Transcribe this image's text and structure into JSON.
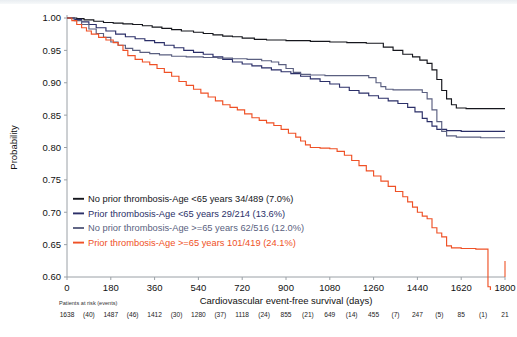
{
  "chart_data": {
    "type": "line",
    "title": "",
    "xlabel": "Cardiovascular event-free survival (days)",
    "ylabel": "Probability",
    "xlim": [
      0,
      1800
    ],
    "ylim": [
      0.6,
      1.0
    ],
    "xticks": [
      0,
      180,
      360,
      540,
      720,
      900,
      1080,
      1260,
      1440,
      1620,
      1800
    ],
    "yticks": [
      "1.00",
      "0.95",
      "0.90",
      "0.85",
      "0.80",
      "0.75",
      "0.70",
      "0.65",
      "0.60"
    ],
    "grid": false,
    "legend_position": "lower-left-inside",
    "series": [
      {
        "name": "No prior thrombosis-Age <65 years 34/489 (7.0%)",
        "color": "#15161c",
        "group": "No prior thrombosis",
        "age": "<65 years",
        "events": 34,
        "n": 489,
        "percent": "7.0%",
        "points": [
          [
            0,
            1.0
          ],
          [
            40,
            0.999
          ],
          [
            70,
            0.997
          ],
          [
            110,
            0.995
          ],
          [
            150,
            0.993
          ],
          [
            190,
            0.992
          ],
          [
            230,
            0.991
          ],
          [
            270,
            0.99
          ],
          [
            310,
            0.988
          ],
          [
            350,
            0.986
          ],
          [
            390,
            0.984
          ],
          [
            430,
            0.982
          ],
          [
            470,
            0.98
          ],
          [
            520,
            0.978
          ],
          [
            560,
            0.976
          ],
          [
            600,
            0.974
          ],
          [
            640,
            0.972
          ],
          [
            680,
            0.971
          ],
          [
            720,
            0.969
          ],
          [
            770,
            0.967
          ],
          [
            820,
            0.966
          ],
          [
            900,
            0.965
          ],
          [
            1000,
            0.964
          ],
          [
            1080,
            0.963
          ],
          [
            1150,
            0.962
          ],
          [
            1230,
            0.961
          ],
          [
            1300,
            0.955
          ],
          [
            1340,
            0.95
          ],
          [
            1380,
            0.944
          ],
          [
            1420,
            0.94
          ],
          [
            1450,
            0.935
          ],
          [
            1480,
            0.93
          ],
          [
            1500,
            0.92
          ],
          [
            1520,
            0.905
          ],
          [
            1540,
            0.888
          ],
          [
            1560,
            0.875
          ],
          [
            1580,
            0.866
          ],
          [
            1600,
            0.861
          ],
          [
            1640,
            0.86
          ],
          [
            1700,
            0.86
          ],
          [
            1800,
            0.86
          ]
        ]
      },
      {
        "name": "Prior thrombosis-Age <65 years 29/214 (13.6%)",
        "color": "#2b2f68",
        "group": "Prior thrombosis",
        "age": "<65 years",
        "events": 29,
        "n": 214,
        "percent": "13.6%",
        "points": [
          [
            0,
            1.0
          ],
          [
            30,
            0.998
          ],
          [
            60,
            0.994
          ],
          [
            90,
            0.99
          ],
          [
            120,
            0.985
          ],
          [
            160,
            0.98
          ],
          [
            200,
            0.975
          ],
          [
            240,
            0.971
          ],
          [
            280,
            0.968
          ],
          [
            320,
            0.965
          ],
          [
            360,
            0.962
          ],
          [
            400,
            0.958
          ],
          [
            440,
            0.954
          ],
          [
            480,
            0.95
          ],
          [
            520,
            0.947
          ],
          [
            560,
            0.944
          ],
          [
            600,
            0.94
          ],
          [
            640,
            0.936
          ],
          [
            680,
            0.932
          ],
          [
            720,
            0.929
          ],
          [
            760,
            0.926
          ],
          [
            800,
            0.923
          ],
          [
            840,
            0.92
          ],
          [
            880,
            0.917
          ],
          [
            920,
            0.914
          ],
          [
            960,
            0.91
          ],
          [
            1000,
            0.906
          ],
          [
            1040,
            0.902
          ],
          [
            1080,
            0.898
          ],
          [
            1120,
            0.893
          ],
          [
            1160,
            0.888
          ],
          [
            1200,
            0.884
          ],
          [
            1240,
            0.88
          ],
          [
            1280,
            0.876
          ],
          [
            1320,
            0.872
          ],
          [
            1360,
            0.868
          ],
          [
            1400,
            0.862
          ],
          [
            1430,
            0.855
          ],
          [
            1460,
            0.845
          ],
          [
            1480,
            0.84
          ],
          [
            1500,
            0.833
          ],
          [
            1520,
            0.828
          ],
          [
            1560,
            0.826
          ],
          [
            1620,
            0.825
          ],
          [
            1700,
            0.825
          ],
          [
            1800,
            0.825
          ]
        ]
      },
      {
        "name": "No prior thrombosis-Age >=65 years 62/516 (12.0%)",
        "color": "#5a5f80",
        "group": "No prior thrombosis",
        "age": ">=65 years",
        "events": 62,
        "n": 516,
        "percent": "12.0%",
        "points": [
          [
            0,
            1.0
          ],
          [
            30,
            0.996
          ],
          [
            60,
            0.99
          ],
          [
            90,
            0.983
          ],
          [
            120,
            0.976
          ],
          [
            150,
            0.97
          ],
          [
            180,
            0.963
          ],
          [
            210,
            0.958
          ],
          [
            240,
            0.953
          ],
          [
            270,
            0.95
          ],
          [
            300,
            0.947
          ],
          [
            340,
            0.945
          ],
          [
            380,
            0.943
          ],
          [
            430,
            0.941
          ],
          [
            490,
            0.94
          ],
          [
            560,
            0.939
          ],
          [
            620,
            0.938
          ],
          [
            680,
            0.937
          ],
          [
            740,
            0.936
          ],
          [
            800,
            0.934
          ],
          [
            840,
            0.932
          ],
          [
            870,
            0.928
          ],
          [
            900,
            0.922
          ],
          [
            930,
            0.916
          ],
          [
            960,
            0.913
          ],
          [
            1000,
            0.912
          ],
          [
            1060,
            0.911
          ],
          [
            1120,
            0.911
          ],
          [
            1180,
            0.911
          ],
          [
            1240,
            0.908
          ],
          [
            1270,
            0.9
          ],
          [
            1290,
            0.894
          ],
          [
            1310,
            0.89
          ],
          [
            1340,
            0.889
          ],
          [
            1400,
            0.889
          ],
          [
            1440,
            0.889
          ],
          [
            1460,
            0.885
          ],
          [
            1480,
            0.875
          ],
          [
            1500,
            0.858
          ],
          [
            1520,
            0.84
          ],
          [
            1540,
            0.825
          ],
          [
            1560,
            0.818
          ],
          [
            1600,
            0.816
          ],
          [
            1700,
            0.815
          ],
          [
            1800,
            0.815
          ]
        ]
      },
      {
        "name": "Prior thrombosis-Age >=65 years 101/419 (24.1%)",
        "color": "#ef5126",
        "group": "Prior thrombosis",
        "age": ">=65 years",
        "events": 101,
        "n": 419,
        "percent": "24.1%",
        "points": [
          [
            0,
            1.0
          ],
          [
            20,
            0.996
          ],
          [
            40,
            0.99
          ],
          [
            60,
            0.985
          ],
          [
            80,
            0.98
          ],
          [
            100,
            0.975
          ],
          [
            130,
            0.97
          ],
          [
            160,
            0.966
          ],
          [
            190,
            0.962
          ],
          [
            210,
            0.958
          ],
          [
            230,
            0.95
          ],
          [
            250,
            0.942
          ],
          [
            280,
            0.936
          ],
          [
            310,
            0.932
          ],
          [
            340,
            0.928
          ],
          [
            370,
            0.922
          ],
          [
            400,
            0.916
          ],
          [
            430,
            0.91
          ],
          [
            460,
            0.902
          ],
          [
            490,
            0.896
          ],
          [
            520,
            0.89
          ],
          [
            550,
            0.884
          ],
          [
            580,
            0.878
          ],
          [
            610,
            0.872
          ],
          [
            640,
            0.866
          ],
          [
            670,
            0.862
          ],
          [
            700,
            0.858
          ],
          [
            730,
            0.852
          ],
          [
            760,
            0.846
          ],
          [
            790,
            0.842
          ],
          [
            820,
            0.838
          ],
          [
            850,
            0.834
          ],
          [
            880,
            0.828
          ],
          [
            910,
            0.822
          ],
          [
            940,
            0.816
          ],
          [
            960,
            0.81
          ],
          [
            980,
            0.804
          ],
          [
            1000,
            0.8
          ],
          [
            1040,
            0.799
          ],
          [
            1080,
            0.798
          ],
          [
            1110,
            0.794
          ],
          [
            1140,
            0.788
          ],
          [
            1170,
            0.78
          ],
          [
            1200,
            0.772
          ],
          [
            1230,
            0.764
          ],
          [
            1260,
            0.756
          ],
          [
            1290,
            0.748
          ],
          [
            1320,
            0.74
          ],
          [
            1350,
            0.732
          ],
          [
            1380,
            0.724
          ],
          [
            1400,
            0.716
          ],
          [
            1420,
            0.708
          ],
          [
            1440,
            0.7
          ],
          [
            1460,
            0.694
          ],
          [
            1480,
            0.69
          ],
          [
            1500,
            0.676
          ],
          [
            1520,
            0.668
          ],
          [
            1540,
            0.662
          ],
          [
            1560,
            0.648
          ],
          [
            1580,
            0.645
          ],
          [
            1620,
            0.644
          ],
          [
            1680,
            0.643
          ],
          [
            1720,
            0.643
          ],
          [
            1730,
            0.585
          ],
          [
            1740,
            0.58
          ]
        ]
      }
    ],
    "at_risk": {
      "label": "Patients at risk (events)",
      "counts": [
        1638,
        1487,
        1412,
        1280,
        1118,
        855,
        649,
        455,
        247,
        85,
        21
      ],
      "events": [
        "(40)",
        "(46)",
        "(30)",
        "(37)",
        "(24)",
        "(21)",
        "(14)",
        "(7)",
        "(5)",
        "(1)"
      ]
    }
  }
}
